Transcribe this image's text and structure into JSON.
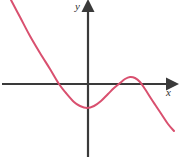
{
  "figure": {
    "name": "cubic-polynomial-graph",
    "background_color": "#ffffff",
    "width": 180,
    "height": 162
  },
  "axes": {
    "color": "#3a3a3a",
    "x_axis": {
      "label": "x",
      "label_icon": "x-axis-arrow-icon",
      "y_pixel": 84,
      "start_x": 2,
      "end_x": 174,
      "arrow": "right"
    },
    "y_axis": {
      "label": "y",
      "label_icon": "y-axis-arrow-icon",
      "x_pixel": 88,
      "start_y": 157,
      "end_y": 4,
      "arrow": "up"
    }
  },
  "chart_data": {
    "type": "line",
    "title": "",
    "xlabel": "x",
    "ylabel": "y",
    "grid": false,
    "legend": "none",
    "series": [
      {
        "name": "cubic-curve",
        "color": "#d9506f",
        "line_width": 2,
        "description": "Negative-leading-coefficient cubic-like curve: falls from upper left, crosses x-axis, reaches a local minimum below the axis, rises to a local maximum just above the axis, then falls to the lower right.",
        "points_pixel": [
          [
            11,
            0
          ],
          [
            20,
            17
          ],
          [
            30,
            36
          ],
          [
            40,
            53
          ],
          [
            50,
            69
          ],
          [
            59,
            84
          ],
          [
            66,
            93
          ],
          [
            74,
            102
          ],
          [
            80,
            106
          ],
          [
            87,
            108
          ],
          [
            94,
            106
          ],
          [
            101,
            101
          ],
          [
            108,
            94
          ],
          [
            114,
            88
          ],
          [
            120,
            83
          ],
          [
            125,
            79
          ],
          [
            130,
            77
          ],
          [
            135,
            78
          ],
          [
            140,
            82
          ],
          [
            145,
            89
          ],
          [
            152,
            100
          ],
          [
            160,
            112
          ],
          [
            168,
            124
          ],
          [
            174,
            131
          ]
        ],
        "x_intercepts_pixel": [
          59,
          120,
          142
        ],
        "local_minimum_pixel": [
          87,
          108
        ],
        "local_maximum_pixel": [
          130,
          77
        ]
      }
    ]
  }
}
